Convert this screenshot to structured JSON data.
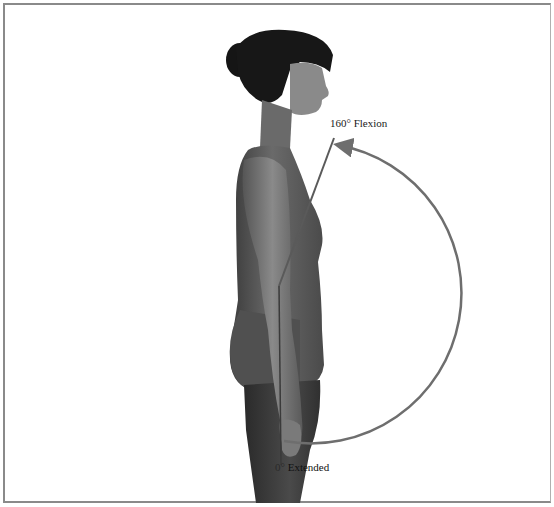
{
  "diagram": {
    "labels": {
      "flexion": "160° Flexion",
      "extended_degree": "0°",
      "extended_text": " Extended"
    },
    "range_of_motion": {
      "start_angle_deg": 0,
      "end_angle_deg": 160,
      "motion": "Flexion"
    },
    "colors": {
      "arc": "#6e6e6e",
      "lines": "#5a5a5a",
      "frame": "#8a8a8a",
      "background": "#ffffff"
    }
  }
}
